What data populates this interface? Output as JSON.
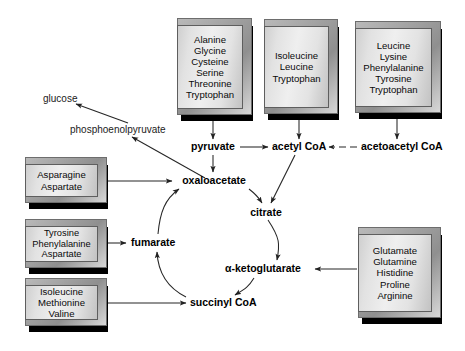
{
  "diagram": {
    "background_color": "#ffffff",
    "line_color": "#2b2b2b",
    "box_face_color": "#e6e6e6",
    "box_edge_color": "#5e5e5e",
    "box_shadow_color": "#000000"
  },
  "groups": [
    {
      "id": "to-pyruvate",
      "aminoacids": [
        "Alanine",
        "Glycine",
        "Cysteine",
        "Serine",
        "Threonine",
        "Tryptophan"
      ],
      "target": "pyruvate"
    },
    {
      "id": "to-acetyl-coa",
      "aminoacids": [
        "Isoleucine",
        "Leucine",
        "Tryptophan"
      ],
      "target": "acetyl CoA"
    },
    {
      "id": "to-acetoacetyl-coa",
      "aminoacids": [
        "Leucine",
        "Lysine",
        "Phenylalanine",
        "Tyrosine",
        "Tryptophan"
      ],
      "target": "acetoacetyl CoA"
    },
    {
      "id": "to-oxaloacetate",
      "aminoacids": [
        "Asparagine",
        "Aspartate"
      ],
      "target": "oxaloacetate"
    },
    {
      "id": "to-fumarate",
      "aminoacids": [
        "Tyrosine",
        "Phenylalanine",
        "Aspartate"
      ],
      "target": "fumarate"
    },
    {
      "id": "to-succinyl-coa",
      "aminoacids": [
        "Isoleucine",
        "Methionine",
        "Valine"
      ],
      "target": "succinyl CoA"
    },
    {
      "id": "to-alpha-ketoglutarate",
      "aminoacids": [
        "Glutamate",
        "Glutamine",
        "Histidine",
        "Proline",
        "Arginine"
      ],
      "target": "α-ketoglutarate"
    }
  ],
  "metabolites": {
    "glucose": "glucose",
    "pep": "phosphoenolpyruvate",
    "pyruvate": "pyruvate",
    "acetyl_coa": "acetyl CoA",
    "acetoacetyl_coa": "acetoacetyl CoA",
    "oxaloacetate": "oxaloacetate",
    "citrate": "citrate",
    "alpha_ketoglutarate": "α-ketoglutarate",
    "succinyl_coa": "succinyl CoA",
    "fumarate": "fumarate"
  },
  "cycle": {
    "name": "citric acid cycle",
    "order": [
      "oxaloacetate",
      "citrate",
      "α-ketoglutarate",
      "succinyl CoA",
      "fumarate",
      "oxaloacetate"
    ]
  },
  "edges": [
    {
      "from": "pyruvate",
      "to": "acetyl CoA",
      "style": "solid"
    },
    {
      "from": "acetoacetyl CoA",
      "to": "acetyl CoA",
      "style": "dashed"
    },
    {
      "from": "pyruvate",
      "to": "oxaloacetate",
      "style": "solid"
    },
    {
      "from": "oxaloacetate",
      "to": "phosphoenolpyruvate",
      "style": "solid"
    },
    {
      "from": "phosphoenolpyruvate",
      "to": "glucose",
      "style": "solid"
    },
    {
      "from": "acetyl CoA",
      "to": "citrate",
      "style": "solid"
    },
    {
      "from": "oxaloacetate",
      "to": "citrate",
      "style": "solid"
    },
    {
      "from": "citrate",
      "to": "α-ketoglutarate",
      "style": "solid"
    },
    {
      "from": "α-ketoglutarate",
      "to": "succinyl CoA",
      "style": "solid"
    },
    {
      "from": "succinyl CoA",
      "to": "fumarate",
      "style": "solid"
    },
    {
      "from": "fumarate",
      "to": "oxaloacetate",
      "style": "solid"
    }
  ]
}
